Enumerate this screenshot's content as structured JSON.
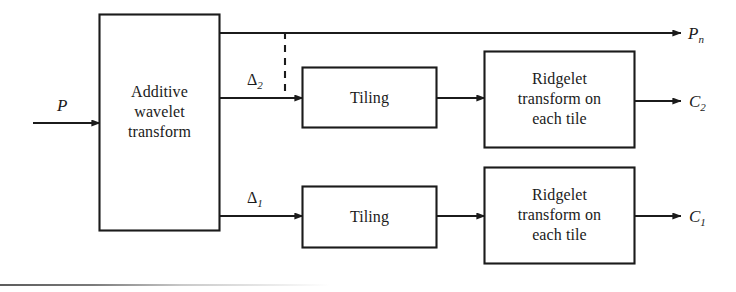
{
  "figure": {
    "stroke_color": "#1b1b1b",
    "background_color": "#ffffff",
    "rule_color": "#5c5c5c"
  },
  "blocks": {
    "additive_wavelet": {
      "label": "Additive\nwavelet\ntransform",
      "x": 99,
      "y": 14,
      "w": 121,
      "h": 217
    },
    "tiling_top": {
      "label": "Tiling",
      "x": 302,
      "y": 67,
      "w": 135,
      "h": 61
    },
    "tiling_bottom": {
      "label": "Tiling",
      "x": 302,
      "y": 186,
      "w": 135,
      "h": 62
    },
    "ridgelet_top": {
      "label": "Ridgelet\ntransform on\neach tile",
      "x": 484,
      "y": 51,
      "w": 151,
      "h": 97
    },
    "ridgelet_bottom": {
      "label": "Ridgelet\ntransform on\neach tile",
      "x": 484,
      "y": 167,
      "w": 151,
      "h": 97
    }
  },
  "signals": {
    "input": {
      "symbol": "P",
      "subscript": ""
    },
    "output_pn": {
      "symbol": "P",
      "subscript": "n"
    },
    "output_c2": {
      "symbol": "C",
      "subscript": "2"
    },
    "output_c1": {
      "symbol": "C",
      "subscript": "1"
    },
    "detail_2": {
      "symbol": "Δ",
      "subscript": "2"
    },
    "detail_1": {
      "symbol": "Δ",
      "subscript": "1"
    }
  },
  "connectors": [
    {
      "name": "input-to-wavelet",
      "from": "input",
      "to": "additive_wavelet",
      "style": "solid"
    },
    {
      "name": "wavelet-to-pn",
      "from": "additive_wavelet",
      "to": "output_pn",
      "style": "solid"
    },
    {
      "name": "wavelet-to-tiling-top",
      "from": "additive_wavelet",
      "to": "tiling_top",
      "style": "solid",
      "label": "detail_2"
    },
    {
      "name": "wavelet-to-tiling-bottom",
      "from": "additive_wavelet",
      "to": "tiling_bottom",
      "style": "solid",
      "label": "detail_1"
    },
    {
      "name": "tiling-top-to-ridgelet-top",
      "from": "tiling_top",
      "to": "ridgelet_top",
      "style": "solid"
    },
    {
      "name": "tiling-bottom-to-ridgelet-bottom",
      "from": "tiling_bottom",
      "to": "ridgelet_bottom",
      "style": "solid"
    },
    {
      "name": "ridgelet-top-to-c2",
      "from": "ridgelet_top",
      "to": "output_c2",
      "style": "solid"
    },
    {
      "name": "ridgelet-bottom-to-c1",
      "from": "ridgelet_bottom",
      "to": "output_c1",
      "style": "solid"
    },
    {
      "name": "scale-separator",
      "from": "wavelet-to-pn",
      "to": "wavelet-to-tiling-top",
      "style": "dashed"
    }
  ]
}
